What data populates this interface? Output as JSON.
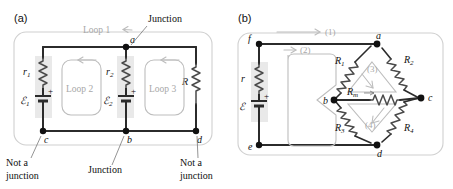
{
  "figure": {
    "type": "circuit-diagram",
    "panels": [
      {
        "id": "a",
        "letter": "(a)",
        "description": "Two-battery circuit with three loops showing junction and non-junction points",
        "nodes": [
          {
            "label": "a",
            "role": "junction"
          },
          {
            "label": "b",
            "role": "junction"
          },
          {
            "label": "c",
            "role": "not-a-junction"
          },
          {
            "label": "d",
            "role": "not-a-junction"
          }
        ],
        "components": [
          {
            "label": "r",
            "sub": "1",
            "type": "resistor"
          },
          {
            "label": "ℰ",
            "sub": "1",
            "type": "battery",
            "polarity": "+"
          },
          {
            "label": "r",
            "sub": "2",
            "type": "resistor"
          },
          {
            "label": "ℰ",
            "sub": "2",
            "type": "battery",
            "polarity": "+"
          },
          {
            "label": "R",
            "sub": "",
            "type": "resistor"
          }
        ],
        "loops": [
          {
            "label": "Loop 1",
            "direction": "counterclockwise"
          },
          {
            "label": "Loop 2",
            "direction": "counterclockwise"
          },
          {
            "label": "Loop 3",
            "direction": "counterclockwise"
          }
        ],
        "callouts": [
          {
            "text": "Junction",
            "points_to": "a"
          },
          {
            "text": "Junction",
            "points_to": "b"
          },
          {
            "text": "Not a junction",
            "line1": "Not a",
            "line2": "junction",
            "points_to": "c"
          },
          {
            "text": "Not a junction",
            "line1": "Not a",
            "line2": "junction",
            "points_to": "d"
          }
        ]
      },
      {
        "id": "b",
        "letter": "(b)",
        "description": "Wheatstone bridge circuit with battery and four numbered loops",
        "nodes": [
          {
            "label": "a"
          },
          {
            "label": "b"
          },
          {
            "label": "c"
          },
          {
            "label": "d"
          },
          {
            "label": "e"
          },
          {
            "label": "f"
          }
        ],
        "components": [
          {
            "label": "r",
            "sub": "",
            "type": "resistor"
          },
          {
            "label": "ℰ",
            "sub": "",
            "type": "battery",
            "polarity": "+"
          },
          {
            "label": "R",
            "sub": "1",
            "type": "resistor"
          },
          {
            "label": "R",
            "sub": "2",
            "type": "resistor"
          },
          {
            "label": "R",
            "sub": "3",
            "type": "resistor"
          },
          {
            "label": "R",
            "sub": "4",
            "type": "resistor"
          },
          {
            "label": "R",
            "sub": "m",
            "type": "resistor"
          }
        ],
        "loops": [
          {
            "label": "(1)",
            "shape": "outer"
          },
          {
            "label": "(2)",
            "shape": "left-pinched"
          },
          {
            "label": "(3)",
            "shape": "upper-triangle"
          },
          {
            "label": "(4)",
            "shape": "lower-triangle"
          }
        ]
      }
    ],
    "colors": {
      "wire": "#2b2b2b",
      "resistor": "#4a4a4a",
      "loop_gray": "#bdbdbd",
      "border_gray": "#d0d0d0",
      "highlight": "#e9e9e9",
      "text": "#111111"
    }
  }
}
